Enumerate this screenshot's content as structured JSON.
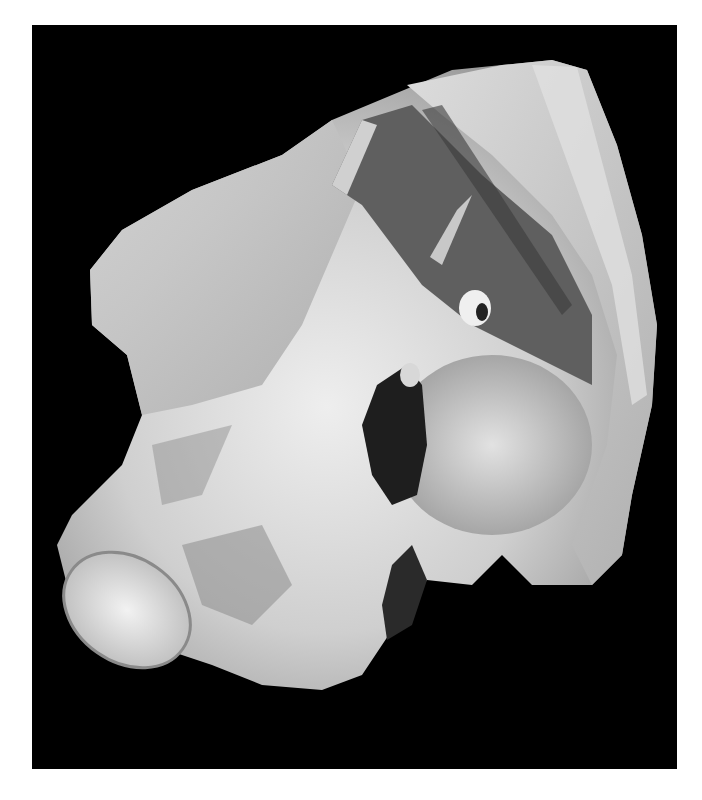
{
  "image": {
    "subject": "dissected anatomical specimen (pelvic bone with attached ligaments and muscles)",
    "background_color": "#000000",
    "page_color": "#ffffff",
    "tone": "grayscale photograph",
    "frame": {
      "left": 32,
      "top": 25,
      "width": 645,
      "height": 744
    }
  },
  "colors": {
    "bone_light": "#e6e6e6",
    "bone_mid": "#c8c8c8",
    "tissue_shadow": "#7a7a7a",
    "membrane_dark": "#5a5a5a",
    "cavity": "#1e1e1e"
  }
}
